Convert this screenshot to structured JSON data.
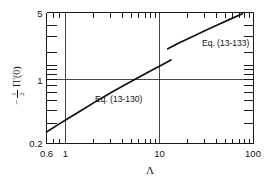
{
  "chart_data": {
    "type": "line",
    "title": "",
    "subtitle": "",
    "xlabel": "Λ",
    "ylabel": "-½ Π'(0)",
    "xscale": "log",
    "yscale": "log",
    "xlim": [
      0.6,
      100
    ],
    "ylim": [
      0.2,
      5
    ],
    "grid": true,
    "legend_position": "inline-annotation",
    "xticklabels": [
      "0.6",
      "1",
      "10",
      "100"
    ],
    "xtickvalues": [
      0.6,
      1,
      10,
      100
    ],
    "yticklabels": [
      "0.2",
      "1",
      "5"
    ],
    "ytickvalues": [
      0.2,
      1,
      5
    ],
    "gridlines_x": [
      1,
      10
    ],
    "gridlines_y": [
      1
    ],
    "annotations": [
      {
        "text": "Eq. (13-130)",
        "x": 3.3,
        "y": 0.62
      },
      {
        "text": "Eq. (13-133)",
        "x": 33,
        "y": 2.6
      }
    ],
    "series": [
      {
        "name": "Eq. (13-130)",
        "x": [
          0.6,
          0.8,
          1.0,
          1.4,
          2.0,
          3.0,
          4.0,
          6.0,
          8.0,
          10.0,
          13.0
        ],
        "y": [
          0.265,
          0.318,
          0.365,
          0.447,
          0.556,
          0.705,
          0.825,
          1.03,
          1.2,
          1.35,
          1.56
        ]
      },
      {
        "name": "Eq. (13-133)",
        "x": [
          12.0,
          16.0,
          22.0,
          30.0,
          42.0,
          58.0,
          76.0
        ],
        "y": [
          2.05,
          2.38,
          2.76,
          3.2,
          3.72,
          4.3,
          4.85
        ]
      }
    ]
  },
  "labels": {
    "x_tick_0": "0.6",
    "x_tick_1": "1",
    "x_tick_2": "10",
    "x_tick_3": "100",
    "y_tick_0": "0.2",
    "y_tick_1": "1",
    "y_tick_2": "5",
    "x_axis_title": "Λ",
    "y_axis_minus": "−",
    "y_axis_num": "1",
    "y_axis_den": "2",
    "y_axis_fn": "Π'(0)",
    "annotation_lower": "Eq. (13-130)",
    "annotation_upper": "Eq. (13-133)"
  },
  "colors": {
    "curve": "#111111",
    "axis": "#1a1a1a",
    "background": "#ffffff",
    "text": "#111111"
  }
}
